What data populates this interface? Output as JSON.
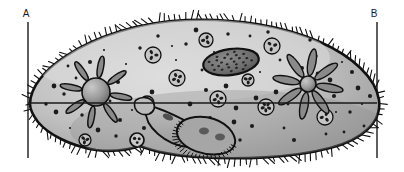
{
  "figure": {
    "kind": "biological-cell-diagram",
    "background_color": "#ffffff",
    "width": 404,
    "height": 172
  },
  "section_line": {
    "label_a": "A",
    "label_b": "B",
    "label_a_x": 26,
    "label_a_y": 17,
    "label_b_x": 374,
    "label_b_y": 17,
    "left_rule_x": 28,
    "right_rule_x": 377,
    "rule_top_y": 22,
    "rule_bottom_y": 158,
    "axis_y": 103,
    "axis_x_start": 28,
    "axis_x_end": 377,
    "line_color": "#1a1a1a"
  },
  "palette": {
    "outline": "#111111",
    "cytoplasm_light": "#d7d7d7",
    "cytoplasm_mid": "#b3b3b3",
    "cytoplasm_dark": "#909090",
    "nucleus_fill": "#6e6e6e",
    "vacuole_sphere": "#8c8c8c",
    "canal_fill": "#8a8a8a",
    "granule": "#1c1c1c",
    "gullet_fill": "#a8a8a8"
  },
  "body": {
    "name": "cell-body",
    "outline_path": "M 30 104 C 30 88 44 70 66 56 C 96 36 140 22 186 20 C 236 18 284 26 320 42 C 352 56 376 78 379 100 C 382 122 362 140 330 148 C 292 158 240 160 196 157 C 170 155 150 150 140 146 C 128 150 112 152 96 150 C 70 146 48 134 38 122 C 32 114 30 109 30 104 Z",
    "cilia_count": 150,
    "cilia_length": 7
  },
  "organelles": [
    {
      "id": "contractile-vacuole-left",
      "label": "contractile vacuole (left)",
      "type": "contractile-vacuole",
      "cx": 96,
      "cy": 92,
      "sphere_r": 14,
      "canal_count": 8,
      "canal_length": 22,
      "canal_width": 6
    },
    {
      "id": "contractile-vacuole-right",
      "label": "contractile vacuole (right)",
      "type": "contractile-vacuole",
      "cx": 308,
      "cy": 84,
      "sphere_r": 8,
      "canal_count": 8,
      "canal_length": 27,
      "canal_width": 8
    },
    {
      "id": "macronucleus",
      "label": "macronucleus",
      "type": "nucleus",
      "cx": 231,
      "cy": 62,
      "rx": 28,
      "ry": 13,
      "rotation": -8,
      "granules": 26
    },
    {
      "id": "oral-groove",
      "label": "oral groove / cytopharynx",
      "type": "gullet"
    },
    {
      "id": "trichocyst-pore",
      "label": "trichocyst pore",
      "type": "pore",
      "cx": 137,
      "cy": 140,
      "r": 7
    }
  ],
  "food_vacuoles": [
    {
      "cx": 153,
      "cy": 55,
      "r": 8,
      "granules": 3
    },
    {
      "cx": 206,
      "cy": 40,
      "r": 7,
      "granules": 3
    },
    {
      "cx": 272,
      "cy": 46,
      "r": 8,
      "granules": 3
    },
    {
      "cx": 177,
      "cy": 78,
      "r": 8,
      "granules": 4
    },
    {
      "cx": 248,
      "cy": 80,
      "r": 6,
      "granules": 3
    },
    {
      "cx": 218,
      "cy": 99,
      "r": 8,
      "granules": 4
    },
    {
      "cx": 266,
      "cy": 107,
      "r": 8,
      "granules": 5
    },
    {
      "cx": 147,
      "cy": 103,
      "r": 7,
      "granules": 2
    },
    {
      "cx": 325,
      "cy": 117,
      "r": 8,
      "granules": 3
    },
    {
      "cx": 85,
      "cy": 140,
      "r": 6,
      "granules": 3
    }
  ],
  "cytoplasm_granules": [
    [
      70,
      128
    ],
    [
      82,
      115
    ],
    [
      98,
      130
    ],
    [
      110,
      101
    ],
    [
      118,
      82
    ],
    [
      126,
      64
    ],
    [
      140,
      48
    ],
    [
      152,
      92
    ],
    [
      160,
      120
    ],
    [
      168,
      135
    ],
    [
      176,
      60
    ],
    [
      186,
      44
    ],
    [
      196,
      30
    ],
    [
      202,
      70
    ],
    [
      210,
      118
    ],
    [
      220,
      136
    ],
    [
      228,
      34
    ],
    [
      236,
      108
    ],
    [
      244,
      60
    ],
    [
      252,
      126
    ],
    [
      260,
      72
    ],
    [
      268,
      32
    ],
    [
      276,
      92
    ],
    [
      284,
      128
    ],
    [
      292,
      58
    ],
    [
      300,
      112
    ],
    [
      310,
      40
    ],
    [
      318,
      74
    ],
    [
      326,
      134
    ],
    [
      334,
      96
    ],
    [
      342,
      62
    ],
    [
      350,
      112
    ],
    [
      358,
      88
    ],
    [
      364,
      126
    ],
    [
      120,
      120
    ],
    [
      132,
      110
    ],
    [
      64,
      94
    ],
    [
      56,
      112
    ],
    [
      76,
      78
    ],
    [
      90,
      62
    ],
    [
      104,
      50
    ],
    [
      116,
      136
    ],
    [
      190,
      104
    ],
    [
      198,
      136
    ],
    [
      206,
      90
    ],
    [
      214,
      52
    ],
    [
      240,
      140
    ],
    [
      256,
      98
    ],
    [
      280,
      60
    ],
    [
      294,
      140
    ],
    [
      306,
      100
    ],
    [
      316,
      56
    ],
    [
      330,
      80
    ],
    [
      344,
      132
    ],
    [
      352,
      72
    ],
    [
      362,
      104
    ],
    [
      46,
      104
    ],
    [
      54,
      86
    ],
    [
      68,
      66
    ],
    [
      144,
      128
    ],
    [
      172,
      46
    ],
    [
      182,
      120
    ],
    [
      234,
      122
    ],
    [
      288,
      104
    ],
    [
      302,
      68
    ],
    [
      336,
      112
    ],
    [
      158,
      36
    ],
    [
      226,
      86
    ],
    [
      250,
      36
    ],
    [
      370,
      96
    ]
  ]
}
